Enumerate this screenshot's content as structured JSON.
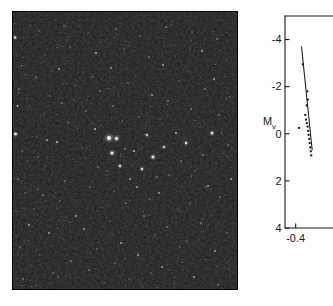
{
  "figure": {
    "panels": [
      "star-field-photograph",
      "color-magnitude-diagram"
    ]
  },
  "plate": {
    "name": "star-cluster-photograph",
    "description": "Dark sky photographic plate of an open star cluster",
    "background_color": "#0d0d0d",
    "star_color": "#f2f2ee",
    "border_color": "#000000",
    "stars": [
      {
        "x": 3.0,
        "y": 26.5,
        "r": 1.1,
        "b": 0.9
      },
      {
        "x": 9.5,
        "y": 55.0,
        "r": 0.7,
        "b": 0.55
      },
      {
        "x": 13.0,
        "y": 63.0,
        "r": 0.6,
        "b": 0.45
      },
      {
        "x": 7.0,
        "y": 78.0,
        "r": 0.8,
        "b": 0.6
      },
      {
        "x": 5.5,
        "y": 95.0,
        "r": 0.9,
        "b": 0.7
      },
      {
        "x": 3.5,
        "y": 123.0,
        "r": 1.3,
        "b": 0.95
      },
      {
        "x": 10.0,
        "y": 140.0,
        "r": 0.7,
        "b": 0.5
      },
      {
        "x": 15.5,
        "y": 150.0,
        "r": 0.6,
        "b": 0.42
      },
      {
        "x": 6.0,
        "y": 168.0,
        "r": 0.8,
        "b": 0.58
      },
      {
        "x": 13.0,
        "y": 182.0,
        "r": 0.7,
        "b": 0.5
      },
      {
        "x": 4.0,
        "y": 200.0,
        "r": 0.6,
        "b": 0.45
      },
      {
        "x": 17.0,
        "y": 214.0,
        "r": 0.9,
        "b": 0.65
      },
      {
        "x": 8.0,
        "y": 236.0,
        "r": 0.7,
        "b": 0.52
      },
      {
        "x": 20.0,
        "y": 255.0,
        "r": 0.6,
        "b": 0.44
      },
      {
        "x": 11.0,
        "y": 268.0,
        "r": 0.8,
        "b": 0.58
      },
      {
        "x": 27.0,
        "y": 20.0,
        "r": 0.7,
        "b": 0.5
      },
      {
        "x": 33.0,
        "y": 44.0,
        "r": 0.6,
        "b": 0.44
      },
      {
        "x": 24.0,
        "y": 66.0,
        "r": 0.8,
        "b": 0.55
      },
      {
        "x": 38.0,
        "y": 85.0,
        "r": 0.7,
        "b": 0.48
      },
      {
        "x": 29.0,
        "y": 104.0,
        "r": 0.6,
        "b": 0.42
      },
      {
        "x": 35.0,
        "y": 129.0,
        "r": 0.9,
        "b": 0.62
      },
      {
        "x": 26.0,
        "y": 146.0,
        "r": 0.7,
        "b": 0.5
      },
      {
        "x": 40.0,
        "y": 163.0,
        "r": 0.6,
        "b": 0.45
      },
      {
        "x": 31.0,
        "y": 184.0,
        "r": 0.8,
        "b": 0.56
      },
      {
        "x": 22.0,
        "y": 198.0,
        "r": 0.7,
        "b": 0.48
      },
      {
        "x": 37.0,
        "y": 222.0,
        "r": 0.9,
        "b": 0.6
      },
      {
        "x": 28.0,
        "y": 244.0,
        "r": 0.6,
        "b": 0.43
      },
      {
        "x": 41.0,
        "y": 262.0,
        "r": 0.7,
        "b": 0.5
      },
      {
        "x": 24.0,
        "y": 274.0,
        "r": 0.6,
        "b": 0.42
      },
      {
        "x": 52.0,
        "y": 15.0,
        "r": 0.8,
        "b": 0.55
      },
      {
        "x": 58.0,
        "y": 36.0,
        "r": 0.7,
        "b": 0.48
      },
      {
        "x": 47.0,
        "y": 58.0,
        "r": 0.9,
        "b": 0.62
      },
      {
        "x": 63.0,
        "y": 74.0,
        "r": 0.6,
        "b": 0.44
      },
      {
        "x": 50.0,
        "y": 92.0,
        "r": 0.8,
        "b": 0.58
      },
      {
        "x": 57.0,
        "y": 112.0,
        "r": 0.7,
        "b": 0.5
      },
      {
        "x": 45.0,
        "y": 131.0,
        "r": 1.0,
        "b": 0.72
      },
      {
        "x": 61.0,
        "y": 148.0,
        "r": 0.6,
        "b": 0.44
      },
      {
        "x": 53.0,
        "y": 170.0,
        "r": 0.8,
        "b": 0.55
      },
      {
        "x": 48.0,
        "y": 190.0,
        "r": 0.7,
        "b": 0.48
      },
      {
        "x": 64.0,
        "y": 205.0,
        "r": 0.9,
        "b": 0.62
      },
      {
        "x": 51.0,
        "y": 228.0,
        "r": 0.6,
        "b": 0.45
      },
      {
        "x": 59.0,
        "y": 250.0,
        "r": 0.8,
        "b": 0.56
      },
      {
        "x": 46.0,
        "y": 266.0,
        "r": 0.7,
        "b": 0.48
      },
      {
        "x": 76.0,
        "y": 22.0,
        "r": 0.7,
        "b": 0.5
      },
      {
        "x": 84.0,
        "y": 42.0,
        "r": 0.9,
        "b": 0.64
      },
      {
        "x": 71.0,
        "y": 61.0,
        "r": 0.6,
        "b": 0.44
      },
      {
        "x": 88.0,
        "y": 80.0,
        "r": 0.8,
        "b": 0.56
      },
      {
        "x": 74.0,
        "y": 100.0,
        "r": 0.7,
        "b": 0.5
      },
      {
        "x": 83.0,
        "y": 118.0,
        "r": 1.0,
        "b": 0.7
      },
      {
        "x": 70.0,
        "y": 137.0,
        "r": 0.6,
        "b": 0.45
      },
      {
        "x": 86.0,
        "y": 156.0,
        "r": 0.8,
        "b": 0.58
      },
      {
        "x": 78.0,
        "y": 176.0,
        "r": 0.7,
        "b": 0.5
      },
      {
        "x": 90.0,
        "y": 196.0,
        "r": 0.6,
        "b": 0.43
      },
      {
        "x": 72.0,
        "y": 218.0,
        "r": 0.9,
        "b": 0.62
      },
      {
        "x": 85.0,
        "y": 238.0,
        "r": 0.7,
        "b": 0.5
      },
      {
        "x": 77.0,
        "y": 259.0,
        "r": 0.8,
        "b": 0.55
      },
      {
        "x": 92.0,
        "y": 272.0,
        "r": 0.6,
        "b": 0.44
      },
      {
        "x": 104.0,
        "y": 18.0,
        "r": 0.8,
        "b": 0.56
      },
      {
        "x": 112.0,
        "y": 38.0,
        "r": 0.6,
        "b": 0.44
      },
      {
        "x": 99.0,
        "y": 57.0,
        "r": 0.9,
        "b": 0.62
      },
      {
        "x": 116.0,
        "y": 72.0,
        "r": 0.7,
        "b": 0.5
      },
      {
        "x": 101.0,
        "y": 95.0,
        "r": 0.8,
        "b": 0.55
      },
      {
        "x": 110.0,
        "y": 110.0,
        "r": 0.7,
        "b": 0.48
      },
      {
        "x": 97.0,
        "y": 127.0,
        "r": 2.0,
        "b": 1.0
      },
      {
        "x": 104.5,
        "y": 127.5,
        "r": 1.6,
        "b": 0.92
      },
      {
        "x": 100.0,
        "y": 142.0,
        "r": 1.5,
        "b": 0.88
      },
      {
        "x": 113.0,
        "y": 138.0,
        "r": 0.8,
        "b": 0.58
      },
      {
        "x": 95.0,
        "y": 160.0,
        "r": 0.7,
        "b": 0.5
      },
      {
        "x": 108.0,
        "y": 155.0,
        "r": 1.2,
        "b": 0.78
      },
      {
        "x": 118.0,
        "y": 168.0,
        "r": 0.9,
        "b": 0.62
      },
      {
        "x": 102.0,
        "y": 180.0,
        "r": 0.7,
        "b": 0.48
      },
      {
        "x": 114.0,
        "y": 192.0,
        "r": 0.8,
        "b": 0.56
      },
      {
        "x": 98.0,
        "y": 210.0,
        "r": 0.6,
        "b": 0.44
      },
      {
        "x": 109.0,
        "y": 232.0,
        "r": 0.9,
        "b": 0.6
      },
      {
        "x": 103.0,
        "y": 252.0,
        "r": 0.7,
        "b": 0.5
      },
      {
        "x": 117.0,
        "y": 268.0,
        "r": 0.6,
        "b": 0.43
      },
      {
        "x": 128.0,
        "y": 25.0,
        "r": 0.7,
        "b": 0.5
      },
      {
        "x": 137.0,
        "y": 46.0,
        "r": 0.8,
        "b": 0.56
      },
      {
        "x": 124.0,
        "y": 65.0,
        "r": 0.6,
        "b": 0.44
      },
      {
        "x": 140.0,
        "y": 84.0,
        "r": 0.9,
        "b": 0.62
      },
      {
        "x": 127.0,
        "y": 106.0,
        "r": 0.7,
        "b": 0.5
      },
      {
        "x": 135.0,
        "y": 124.0,
        "r": 1.1,
        "b": 0.74
      },
      {
        "x": 122.0,
        "y": 140.0,
        "r": 1.0,
        "b": 0.7
      },
      {
        "x": 141.0,
        "y": 146.0,
        "r": 1.4,
        "b": 0.86
      },
      {
        "x": 130.0,
        "y": 158.0,
        "r": 1.2,
        "b": 0.78
      },
      {
        "x": 145.0,
        "y": 166.0,
        "r": 0.8,
        "b": 0.55
      },
      {
        "x": 125.0,
        "y": 176.0,
        "r": 0.9,
        "b": 0.6
      },
      {
        "x": 138.0,
        "y": 188.0,
        "r": 0.7,
        "b": 0.48
      },
      {
        "x": 132.0,
        "y": 205.0,
        "r": 0.8,
        "b": 0.56
      },
      {
        "x": 143.0,
        "y": 224.0,
        "r": 0.6,
        "b": 0.44
      },
      {
        "x": 126.0,
        "y": 244.0,
        "r": 0.9,
        "b": 0.62
      },
      {
        "x": 139.0,
        "y": 262.0,
        "r": 0.7,
        "b": 0.5
      },
      {
        "x": 131.0,
        "y": 276.0,
        "r": 0.6,
        "b": 0.42
      },
      {
        "x": 154.0,
        "y": 16.0,
        "r": 0.8,
        "b": 0.55
      },
      {
        "x": 163.0,
        "y": 34.0,
        "r": 0.6,
        "b": 0.44
      },
      {
        "x": 151.0,
        "y": 54.0,
        "r": 0.9,
        "b": 0.62
      },
      {
        "x": 167.0,
        "y": 70.0,
        "r": 0.7,
        "b": 0.5
      },
      {
        "x": 156.0,
        "y": 90.0,
        "r": 0.8,
        "b": 0.56
      },
      {
        "x": 148.0,
        "y": 108.0,
        "r": 0.6,
        "b": 0.44
      },
      {
        "x": 164.0,
        "y": 122.0,
        "r": 1.0,
        "b": 0.68
      },
      {
        "x": 152.0,
        "y": 136.0,
        "r": 1.1,
        "b": 0.74
      },
      {
        "x": 169.0,
        "y": 150.0,
        "r": 0.8,
        "b": 0.56
      },
      {
        "x": 157.0,
        "y": 164.0,
        "r": 0.7,
        "b": 0.5
      },
      {
        "x": 147.0,
        "y": 182.0,
        "r": 0.9,
        "b": 0.6
      },
      {
        "x": 165.0,
        "y": 198.0,
        "r": 0.6,
        "b": 0.44
      },
      {
        "x": 155.0,
        "y": 216.0,
        "r": 0.8,
        "b": 0.55
      },
      {
        "x": 168.0,
        "y": 236.0,
        "r": 0.7,
        "b": 0.48
      },
      {
        "x": 150.0,
        "y": 256.0,
        "r": 0.9,
        "b": 0.62
      },
      {
        "x": 162.0,
        "y": 272.0,
        "r": 0.6,
        "b": 0.43
      },
      {
        "x": 180.0,
        "y": 21.0,
        "r": 0.7,
        "b": 0.5
      },
      {
        "x": 190.0,
        "y": 40.0,
        "r": 0.9,
        "b": 0.62
      },
      {
        "x": 176.0,
        "y": 60.0,
        "r": 0.6,
        "b": 0.44
      },
      {
        "x": 193.0,
        "y": 78.0,
        "r": 0.8,
        "b": 0.56
      },
      {
        "x": 179.0,
        "y": 98.0,
        "r": 0.7,
        "b": 0.5
      },
      {
        "x": 188.0,
        "y": 116.0,
        "r": 0.6,
        "b": 0.45
      },
      {
        "x": 174.0,
        "y": 132.0,
        "r": 1.2,
        "b": 0.8
      },
      {
        "x": 191.0,
        "y": 144.0,
        "r": 0.8,
        "b": 0.55
      },
      {
        "x": 183.0,
        "y": 160.0,
        "r": 0.7,
        "b": 0.48
      },
      {
        "x": 196.0,
        "y": 175.0,
        "r": 0.9,
        "b": 0.62
      },
      {
        "x": 178.0,
        "y": 192.0,
        "r": 0.6,
        "b": 0.44
      },
      {
        "x": 189.0,
        "y": 212.0,
        "r": 0.8,
        "b": 0.56
      },
      {
        "x": 175.0,
        "y": 230.0,
        "r": 0.7,
        "b": 0.5
      },
      {
        "x": 194.0,
        "y": 248.0,
        "r": 0.6,
        "b": 0.43
      },
      {
        "x": 182.0,
        "y": 266.0,
        "r": 0.9,
        "b": 0.6
      },
      {
        "x": 205.0,
        "y": 28.0,
        "r": 0.8,
        "b": 0.55
      },
      {
        "x": 214.0,
        "y": 48.0,
        "r": 0.6,
        "b": 0.44
      },
      {
        "x": 202.0,
        "y": 68.0,
        "r": 0.9,
        "b": 0.62
      },
      {
        "x": 218.0,
        "y": 86.0,
        "r": 0.7,
        "b": 0.5
      },
      {
        "x": 207.0,
        "y": 104.0,
        "r": 0.8,
        "b": 0.56
      },
      {
        "x": 200.0,
        "y": 122.0,
        "r": 1.3,
        "b": 0.84
      },
      {
        "x": 216.0,
        "y": 134.0,
        "r": 0.7,
        "b": 0.48
      },
      {
        "x": 204.0,
        "y": 152.0,
        "r": 0.6,
        "b": 0.44
      },
      {
        "x": 219.0,
        "y": 168.0,
        "r": 0.9,
        "b": 0.62
      },
      {
        "x": 208.0,
        "y": 186.0,
        "r": 0.8,
        "b": 0.55
      },
      {
        "x": 199.0,
        "y": 204.0,
        "r": 0.6,
        "b": 0.43
      },
      {
        "x": 215.0,
        "y": 222.0,
        "r": 0.7,
        "b": 0.5
      },
      {
        "x": 203.0,
        "y": 240.0,
        "r": 0.9,
        "b": 0.6
      },
      {
        "x": 217.0,
        "y": 258.0,
        "r": 0.6,
        "b": 0.44
      },
      {
        "x": 206.0,
        "y": 274.0,
        "r": 0.8,
        "b": 0.55
      }
    ]
  },
  "chart_data": {
    "type": "scatter",
    "title": "",
    "xlabel": "",
    "ylabel": "M_v",
    "ylabel_base": "M",
    "ylabel_sub": "v",
    "xlim": [
      -0.5,
      -0.05
    ],
    "ylim": [
      4,
      -5
    ],
    "y_inverted": true,
    "grid": false,
    "legend": null,
    "note": "Color-magnitude diagram; right side of plot is cropped by the image edge",
    "yticks": [
      -4,
      -2,
      0,
      2,
      4
    ],
    "ytick_labels": [
      "-4",
      "-2",
      "0",
      "2",
      "4"
    ],
    "xticks": [
      -0.4
    ],
    "xtick_labels": [
      "-0.4"
    ],
    "series": [
      {
        "name": "cluster-members",
        "marker": "dot",
        "points": [
          {
            "x": -0.333,
            "y": -2.95
          },
          {
            "x": -0.291,
            "y": -1.8
          },
          {
            "x": -0.286,
            "y": -1.45
          },
          {
            "x": -0.296,
            "y": -1.2
          },
          {
            "x": -0.31,
            "y": -0.8
          },
          {
            "x": -0.303,
            "y": -0.6
          },
          {
            "x": -0.296,
            "y": -0.45
          },
          {
            "x": -0.288,
            "y": -0.3
          },
          {
            "x": -0.283,
            "y": -0.12
          },
          {
            "x": -0.278,
            "y": 0.05
          },
          {
            "x": -0.273,
            "y": 0.22
          },
          {
            "x": -0.268,
            "y": 0.4
          },
          {
            "x": -0.263,
            "y": 0.58
          },
          {
            "x": -0.258,
            "y": 0.75
          },
          {
            "x": -0.254,
            "y": 0.92
          },
          {
            "x": -0.369,
            "y": -0.25
          }
        ]
      }
    ],
    "fit_line": {
      "name": "zero-age-main-sequence",
      "style": "solid",
      "points": [
        {
          "x": -0.345,
          "y": -3.7
        },
        {
          "x": -0.245,
          "y": 0.7
        }
      ]
    }
  }
}
